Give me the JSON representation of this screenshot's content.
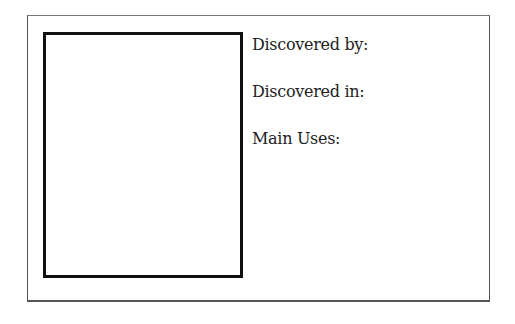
{
  "card": {
    "fields": [
      {
        "label": "Discovered by:"
      },
      {
        "label": "Discovered in:"
      },
      {
        "label": "Main Uses:"
      }
    ]
  }
}
